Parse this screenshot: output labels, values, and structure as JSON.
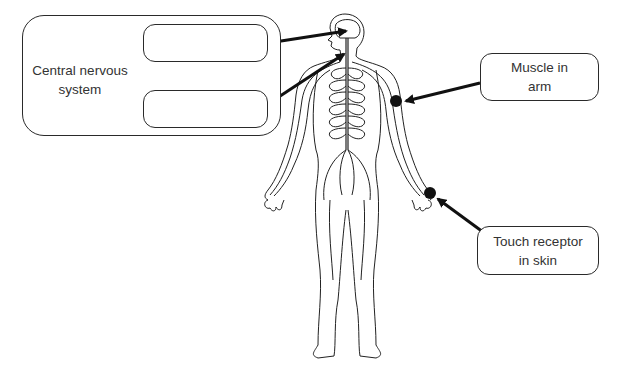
{
  "diagram": {
    "type": "labelled body diagram",
    "cns_group": {
      "label": "Central nervous system",
      "label_line1": "Central nervous",
      "label_line2": "system",
      "blank_boxes": [
        {
          "id": "blank-1",
          "text": "",
          "points_to": "brain"
        },
        {
          "id": "blank-2",
          "text": "",
          "points_to": "spinal cord"
        }
      ]
    },
    "labels": [
      {
        "id": "muscle",
        "line1": "Muscle in",
        "line2": "arm",
        "points_to": "upper arm"
      },
      {
        "id": "touch",
        "line1": "Touch receptor",
        "line2": "in skin",
        "points_to": "hand"
      }
    ],
    "colors": {
      "line": "#1a1a1a",
      "box_border": "#2a2a2a",
      "text": "#333333",
      "background": "#ffffff"
    }
  }
}
